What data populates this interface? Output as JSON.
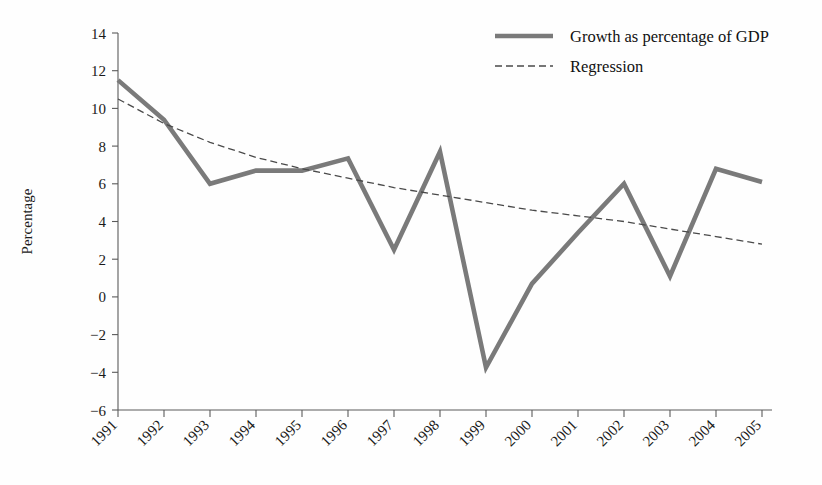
{
  "chart_data": {
    "type": "line",
    "title": "",
    "xlabel": "",
    "ylabel": "Percentage",
    "categories": [
      "1991",
      "1992",
      "1993",
      "1994",
      "1995",
      "1996",
      "1997",
      "1998",
      "1999",
      "2000",
      "2001",
      "2002",
      "2003",
      "2004",
      "2005"
    ],
    "x": [
      1991,
      1992,
      1993,
      1994,
      1995,
      1996,
      1997,
      1998,
      1999,
      2000,
      2001,
      2002,
      2003,
      2004,
      2005
    ],
    "ylim": [
      -6,
      14
    ],
    "xlim": [
      1991,
      2005
    ],
    "yticks": [
      -6,
      -4,
      -2,
      0,
      2,
      4,
      6,
      8,
      10,
      12,
      14
    ],
    "ytick_labels": [
      "−6",
      "−4",
      "−2",
      "0",
      "2",
      "4",
      "6",
      "8",
      "10",
      "12",
      "14"
    ],
    "grid": false,
    "legend_position": "top-right",
    "series": [
      {
        "name": "Growth as percentage of GDP",
        "style": "solid-thick",
        "color": "#7a7a7a",
        "values": [
          11.5,
          9.4,
          6.0,
          6.7,
          6.7,
          7.35,
          2.5,
          7.7,
          -3.75,
          0.7,
          3.4,
          6.0,
          1.1,
          6.8,
          6.1
        ]
      },
      {
        "name": "Regression",
        "style": "dashed-thin",
        "color": "#4a4a4a",
        "values": [
          10.5,
          9.2,
          8.2,
          7.4,
          6.8,
          6.3,
          5.8,
          5.4,
          5.0,
          4.6,
          4.3,
          4.0,
          3.6,
          3.2,
          2.8
        ]
      }
    ]
  },
  "legend": {
    "items": [
      {
        "label": "Growth as percentage of GDP",
        "style": "solid-thick"
      },
      {
        "label": "Regression",
        "style": "dashed-thin"
      }
    ]
  },
  "axes": {
    "y_title": "Percentage"
  }
}
